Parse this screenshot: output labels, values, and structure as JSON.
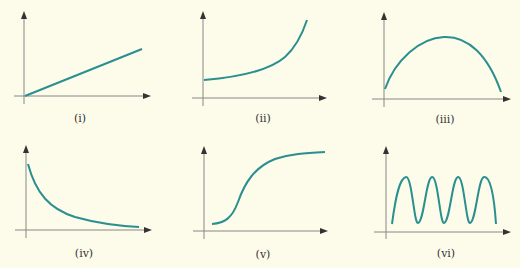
{
  "colors": {
    "background": "#fdfbea",
    "curve": "#2a8f8f",
    "axis": "#888888",
    "arrowhead": "#333333",
    "caption": "#333333"
  },
  "panels": [
    {
      "label": "(i)",
      "shape": "linear increasing"
    },
    {
      "label": "(ii)",
      "shape": "exponential growth"
    },
    {
      "label": "(iii)",
      "shape": "inverted parabola"
    },
    {
      "label": "(iv)",
      "shape": "exponential decay"
    },
    {
      "label": "(v)",
      "shape": "sigmoid / logistic"
    },
    {
      "label": "(vi)",
      "shape": "sinusoidal oscillation"
    }
  ]
}
